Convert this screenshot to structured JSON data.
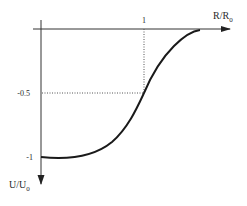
{
  "diagram": {
    "type": "function-plot",
    "x_axis": {
      "label_main": "R/R",
      "label_sub": "0",
      "direction": "right"
    },
    "y_axis": {
      "label_main": "U/U",
      "label_sub": "0",
      "direction": "down"
    },
    "x_ticks": [
      {
        "label": "1",
        "value": 1
      }
    ],
    "y_ticks": [
      {
        "label": "-0.5",
        "value": -0.5
      },
      {
        "label": "-1",
        "value": -1
      }
    ],
    "guides": [
      {
        "kind": "dotted-vertical",
        "at_x": 1,
        "from_y": 0,
        "to_y": -0.5
      },
      {
        "kind": "dotted-horizontal",
        "at_y": -0.5,
        "from_x": 0,
        "to_x": 1
      }
    ],
    "curve": {
      "description": "Sigmoid-like curve rising from -1 at R=0 through -0.5 at R=R0 to 0 near R≈1.55 R0",
      "points": [
        [
          0,
          -1
        ],
        [
          0.3,
          -0.98
        ],
        [
          0.6,
          -0.88
        ],
        [
          0.85,
          -0.7
        ],
        [
          1.0,
          -0.5
        ],
        [
          1.15,
          -0.3
        ],
        [
          1.3,
          -0.13
        ],
        [
          1.45,
          -0.03
        ],
        [
          1.55,
          0
        ]
      ]
    },
    "colors": {
      "line": "#1a1a1a",
      "axis": "#333333",
      "guide": "#555555"
    }
  }
}
